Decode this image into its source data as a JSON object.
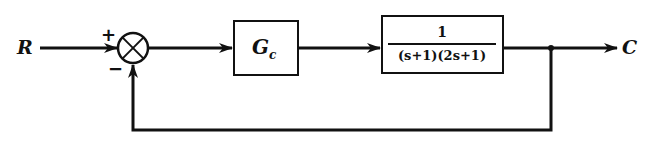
{
  "diagram": {
    "type": "block-diagram",
    "input": {
      "label": "R"
    },
    "output": {
      "label": "C"
    },
    "summing_junction": {
      "plus_sign": "+",
      "minus_sign": "−"
    },
    "blocks": [
      {
        "id": "controller",
        "label": "G",
        "subscript": "c"
      },
      {
        "id": "plant",
        "numerator": "1",
        "denominator": "(s+1)(2s+1)"
      }
    ],
    "feedback": "unity negative feedback",
    "colors": {
      "stroke": "#111111",
      "background": "#ffffff"
    }
  }
}
